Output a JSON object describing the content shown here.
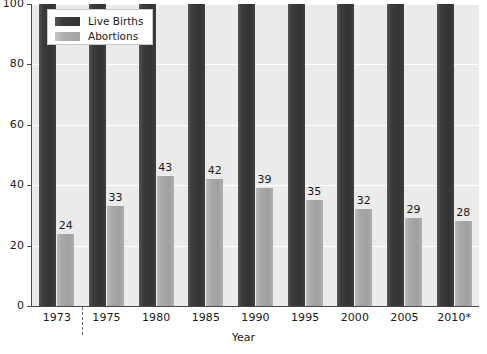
{
  "chart_data": {
    "type": "bar",
    "title": "",
    "xlabel": "Year",
    "ylabel": "",
    "ylim": [
      0,
      100
    ],
    "grid": true,
    "legend_position": "top-left",
    "categories": [
      "1973",
      "1975",
      "1980",
      "1985",
      "1990",
      "1995",
      "2000",
      "2005",
      "2010*"
    ],
    "series": [
      {
        "name": "Live Births",
        "color": "#3a3a3a",
        "values": [
          100,
          100,
          100,
          100,
          100,
          100,
          100,
          100,
          100
        ],
        "show_labels": false
      },
      {
        "name": "Abortions",
        "color": "#a8a8a8",
        "values": [
          24,
          33,
          43,
          42,
          39,
          35,
          32,
          29,
          28
        ],
        "show_labels": true
      }
    ],
    "y_ticks": [
      0,
      20,
      40,
      60,
      80,
      100
    ],
    "y_tick_labels": [
      "0",
      "20",
      "40",
      "60",
      "80",
      "100"
    ],
    "annotations": [
      {
        "name": "period-divider",
        "type": "dashed-vertical-line",
        "between": [
          "1973",
          "1975"
        ]
      }
    ]
  },
  "legend": {
    "items": [
      {
        "label": "Live Births",
        "swatch": "dark"
      },
      {
        "label": "Abortions",
        "swatch": "light"
      }
    ]
  },
  "axis": {
    "x_title": "Year"
  },
  "colors": {
    "plot_background": "#ebebeb",
    "gridline": "#ffffff",
    "axis": "#4a4a4a",
    "text": "#1a1a1a",
    "bar_dark": "#3a3a3a",
    "bar_light": "#a8a8a8",
    "legend_border": "#c8c8c8"
  }
}
